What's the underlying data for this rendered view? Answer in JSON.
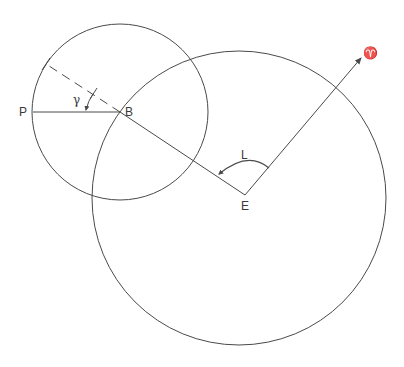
{
  "diagram": {
    "colors": {
      "stroke": "#4a4a4a",
      "background": "#ffffff"
    },
    "labels": {
      "P": "P",
      "B": "B",
      "E": "E",
      "L": "L",
      "gamma": "γ",
      "aries": "♈"
    },
    "points": {
      "B": [
        120,
        112
      ],
      "P": [
        33,
        112
      ],
      "E": [
        245,
        195
      ],
      "aries_tip": [
        362,
        57
      ],
      "dashed_end": [
        46,
        64
      ]
    },
    "small_circle": {
      "center": [
        120,
        112
      ],
      "radius": 88
    },
    "large_circle": {
      "center": [
        239,
        198
      ],
      "radius": 147
    }
  }
}
